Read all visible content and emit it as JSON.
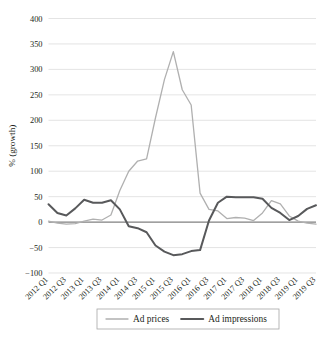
{
  "chart_data": {
    "type": "line",
    "title": "",
    "xlabel": "",
    "ylabel": "% (growth)",
    "ylim": [
      -100,
      400
    ],
    "ytick_step": 50,
    "yticks": [
      "400",
      "350",
      "300",
      "250",
      "200",
      "150",
      "100",
      "50",
      "0",
      "-50",
      "-100"
    ],
    "ytick_values": [
      400,
      350,
      300,
      250,
      200,
      150,
      100,
      50,
      0,
      -50,
      -100
    ],
    "grid": "horizontal",
    "legend_position": "bottom",
    "categories": [
      "2012 Q1",
      "2012 Q2",
      "2012 Q3",
      "2012 Q4",
      "2013 Q1",
      "2013 Q2",
      "2013 Q3",
      "2013 Q4",
      "2014 Q1",
      "2014 Q2",
      "2014 Q3",
      "2014 Q4",
      "2015 Q1",
      "2015 Q2",
      "2015 Q3",
      "2015 Q4",
      "2016 Q1",
      "2016 Q2",
      "2016 Q3",
      "2016 Q4",
      "2017 Q1",
      "2017 Q2",
      "2017 Q3",
      "2017 Q4",
      "2018 Q1",
      "2018 Q2",
      "2018 Q3",
      "2018 Q4",
      "2019 Q1",
      "2019 Q2",
      "2019 Q3"
    ],
    "xtick_labels": [
      "2012 Q1",
      "2012 Q3",
      "2013 Q1",
      "2013 Q3",
      "2014 Q1",
      "2014 Q3",
      "2015 Q1",
      "2015 Q3",
      "2016 Q1",
      "2016 Q3",
      "2017 Q1",
      "2017 Q3",
      "2018 Q1",
      "2018 Q3",
      "2019 Q1",
      "2019 Q3"
    ],
    "series": [
      {
        "name": "Ad prices",
        "color": "#b0b0b0",
        "width": 1.3,
        "values": [
          2,
          -2,
          -4,
          -3,
          2,
          6,
          4,
          14,
          62,
          100,
          120,
          124,
          205,
          280,
          335,
          260,
          230,
          57,
          25,
          22,
          7,
          9,
          8,
          3,
          18,
          42,
          36,
          12,
          2,
          -2,
          -4
        ]
      },
      {
        "name": "Ad impressions",
        "color": "#58595b",
        "width": 2.0,
        "values": [
          35,
          18,
          13,
          27,
          44,
          38,
          38,
          43,
          25,
          -8,
          -12,
          -20,
          -46,
          -58,
          -65,
          -63,
          -57,
          -55,
          3,
          38,
          50,
          49,
          49,
          49,
          46,
          28,
          18,
          4,
          12,
          26,
          33
        ]
      }
    ],
    "series_end_values": {
      "Ad prices": -5,
      "Ad impressions": 37
    }
  },
  "legend": {
    "entries": [
      {
        "label": "Ad prices",
        "color": "#b0b0b0"
      },
      {
        "label": "Ad impressions",
        "color": "#58595b"
      }
    ]
  },
  "axis": {
    "y_title": "% (growth)"
  }
}
